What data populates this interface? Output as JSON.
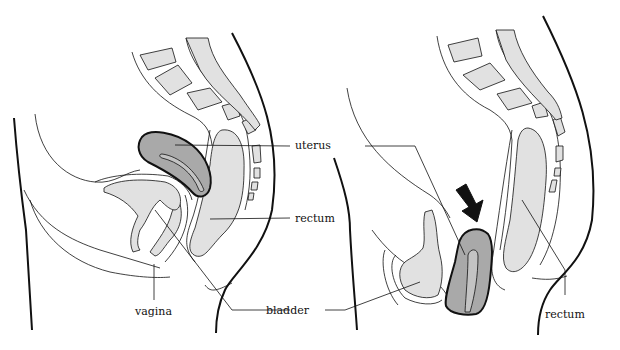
{
  "figure": {
    "type": "anatomical sagittal comparison",
    "panels": [
      {
        "id": "left",
        "description": "normal position",
        "labels": {
          "uterus": "uterus",
          "rectum": "rectum",
          "vagina": "vagina",
          "bladder": "bladder"
        }
      },
      {
        "id": "right",
        "description": "prolapsed uterus",
        "labels": {
          "rectum": "rectum"
        },
        "arrow": "down-right arrow pointing at prolapsed uterus"
      }
    ],
    "shared_labels": {
      "uterus": "uterus",
      "bladder": "bladder"
    }
  },
  "colors": {
    "uterus_fill": "#a9a9a9",
    "organ_fill": "#e1e1e1",
    "outline": "#111111",
    "background": "#ffffff"
  }
}
